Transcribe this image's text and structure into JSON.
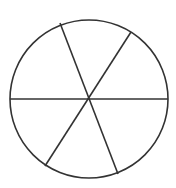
{
  "diagram": {
    "type": "circle-divided-into-sectors",
    "sector_count": 6,
    "stroke_color": "#333333",
    "background": "#ffffff",
    "circle": {
      "cx": 89,
      "cy": 99,
      "r": 79
    },
    "spokes": [
      {
        "x1": 60,
        "y1": 23,
        "x2": 118,
        "y2": 174
      },
      {
        "x1": 131,
        "y1": 32,
        "x2": 45,
        "y2": 166
      },
      {
        "x1": 10,
        "y1": 99,
        "x2": 168,
        "y2": 99
      }
    ]
  }
}
